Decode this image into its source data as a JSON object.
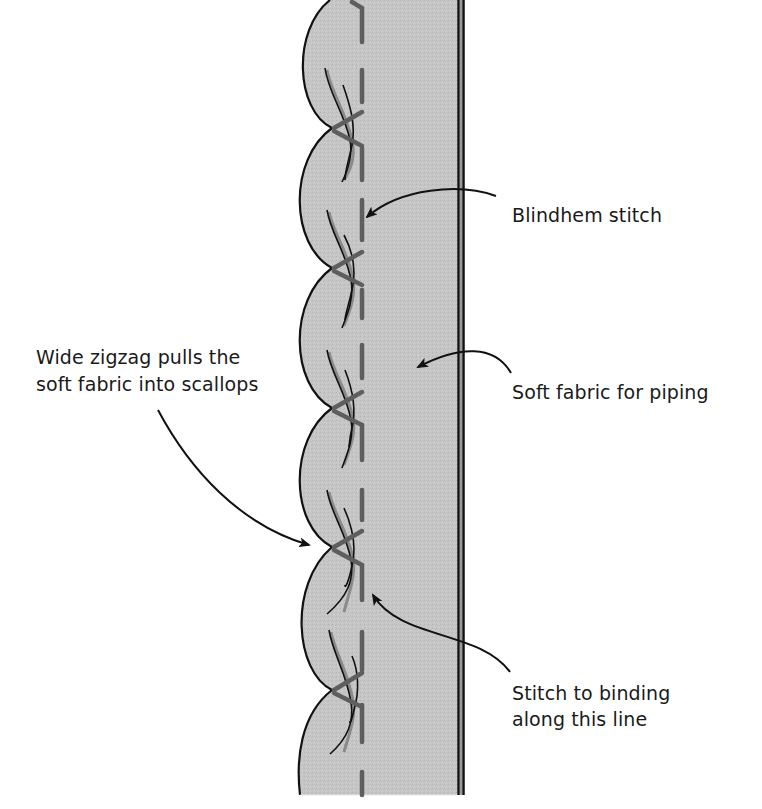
{
  "diagram": {
    "colors": {
      "background": "#ffffff",
      "fabric_fill": "#c6c6c6",
      "outline": "#111111",
      "stitch": "#5e5e5e",
      "thread_shadow": "#8a8a8a",
      "text": "#1a1a1a"
    },
    "labels": {
      "blindhem": "Blindhem stitch",
      "zigzag_line1": "Wide zigzag pulls the",
      "zigzag_line2": "soft fabric into scallops",
      "soft_fabric": "Soft fabric for piping",
      "binding_line1": "Stitch to binding",
      "binding_line2": "along this line"
    },
    "elements": {
      "fabric_strip": "soft fabric strip with scalloped left edge",
      "binding_edge": "double line along right edge",
      "stitch_line": "dashed vertical stitching line",
      "zigzag_stitches": 5,
      "scallops": 6
    }
  }
}
